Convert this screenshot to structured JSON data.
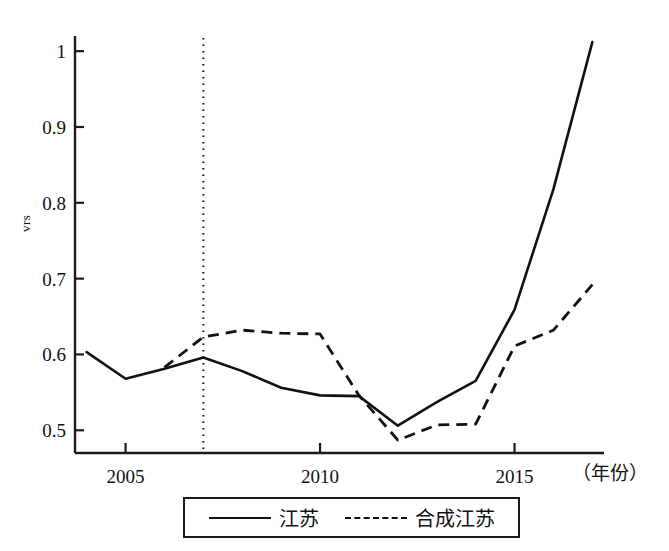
{
  "chart_data": {
    "type": "line",
    "title": "",
    "xlabel": "（年份）",
    "ylabel": "vrs",
    "x": [
      2004,
      2005,
      2006,
      2007,
      2008,
      2009,
      2010,
      2011,
      2012,
      2013,
      2014,
      2015,
      2016,
      2017
    ],
    "xlim": [
      2003.7,
      2017.3
    ],
    "ylim": [
      0.47,
      1.02
    ],
    "yticks": [
      0.5,
      0.6,
      0.7,
      0.8,
      0.9,
      1.0
    ],
    "ytick_labels": [
      "0.5",
      "0.6",
      "0.7",
      "0.8",
      "0.9",
      "1"
    ],
    "xticks": [
      2005,
      2010,
      2015
    ],
    "xtick_labels": [
      "2005",
      "2010",
      "2015"
    ],
    "grid": false,
    "legend_position": "below-axes",
    "annotations": [
      {
        "name": "treatment-year-marker",
        "type": "vertical-dotted-line",
        "x": 2007
      }
    ],
    "series": [
      {
        "name": "江苏",
        "style": "solid",
        "color": "#111111",
        "values": [
          0.603,
          0.568,
          0.581,
          0.596,
          0.578,
          0.556,
          0.546,
          0.545,
          0.506,
          0.537,
          0.565,
          0.659,
          0.818,
          1.012
        ]
      },
      {
        "name": "合成江苏",
        "style": "dashed",
        "color": "#111111",
        "values": [
          null,
          null,
          0.583,
          0.623,
          0.632,
          0.628,
          0.627,
          0.546,
          0.487,
          0.507,
          0.508,
          0.611,
          0.632,
          0.692
        ]
      }
    ]
  },
  "axes": {
    "y_title": "vrs",
    "x_unit_label": "（年份）"
  },
  "legend": {
    "items": [
      {
        "label": "江苏",
        "style": "solid"
      },
      {
        "label": "合成江苏",
        "style": "dashed"
      }
    ]
  },
  "colors": {
    "line": "#111111",
    "axis": "#1a1a1a",
    "background": "#ffffff"
  }
}
